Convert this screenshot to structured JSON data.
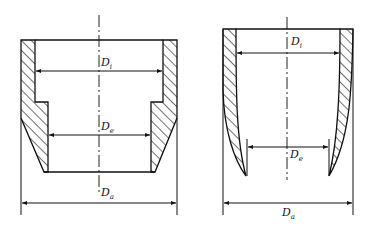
{
  "figure": {
    "left_part": {
      "name": "stepped-tapered-cup",
      "dimensions": {
        "inner": {
          "symbol": "D",
          "subscript": "i"
        },
        "edge": {
          "symbol": "D",
          "subscript": "e"
        },
        "outer": {
          "symbol": "D",
          "subscript": "a"
        }
      }
    },
    "right_part": {
      "name": "curved-wall-cup",
      "dimensions": {
        "inner": {
          "symbol": "D",
          "subscript": "i"
        },
        "edge": {
          "symbol": "D",
          "subscript": "e"
        },
        "outer": {
          "symbol": "D",
          "subscript": "a"
        }
      }
    },
    "colors": {
      "ink": "#111111",
      "background": "#ffffff"
    }
  }
}
